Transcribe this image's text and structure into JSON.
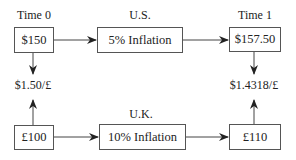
{
  "diagram": {
    "labels": {
      "time0": "Time 0",
      "us": "U.S.",
      "time1": "Time 1",
      "uk": "U.K.",
      "rate0": "$1.50/£",
      "rate1": "$1.4318/£"
    },
    "boxes": {
      "us_start": "$150",
      "us_inflation": "5% Inflation",
      "us_end": "$157.50",
      "uk_start": "£100",
      "uk_inflation": "10% Inflation",
      "uk_end": "£110"
    },
    "colors": {
      "line": "#333333",
      "border": "#555555",
      "text": "#222222"
    }
  }
}
